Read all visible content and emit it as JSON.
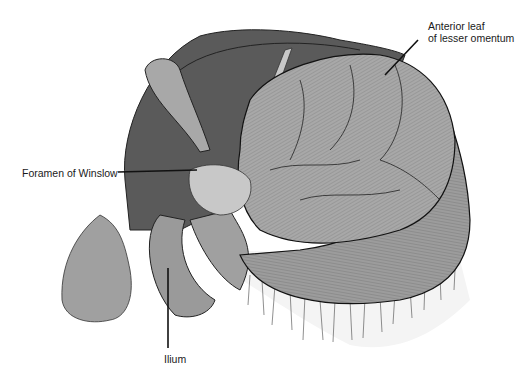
{
  "figure": {
    "labels": [
      {
        "id": "anterior-leaf",
        "line1": "Anterior leaf",
        "line2": "of lesser omentum"
      },
      {
        "id": "foramen",
        "text": "Foramen of Winslow"
      },
      {
        "id": "ilium",
        "text": "Ilium"
      }
    ]
  },
  "colors": {
    "liver": "#5a5a5a",
    "liver_dark": "#454545",
    "organ_light": "#a8a8a8",
    "organ_mid": "#9a9a9a",
    "outline": "#111111",
    "omentum": "#f4f4f4",
    "label_text": "#1a1a1a"
  }
}
